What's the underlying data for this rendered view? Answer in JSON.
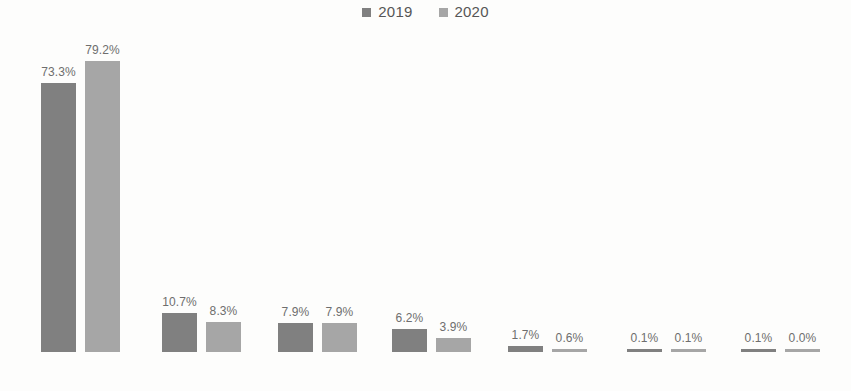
{
  "legend": {
    "position": "top-center",
    "entries": [
      {
        "label": "2019",
        "color": "#808080",
        "swatch_name": "legend-swatch-2019"
      },
      {
        "label": "2020",
        "color": "#a6a6a6",
        "swatch_name": "legend-swatch-2020"
      }
    ]
  },
  "axis": {
    "baseline_visible": true,
    "baseline_color": "#d8d8d6",
    "grid": false
  },
  "chart_data": {
    "type": "bar",
    "title": "",
    "subtitle": "",
    "xlabel": "",
    "ylabel": "",
    "ylim": [
      0,
      85
    ],
    "grid": false,
    "legend_position": "top-center",
    "value_format": "percent",
    "categories": [
      "China",
      "ASEAN",
      "United States",
      "Japan",
      "European  Union",
      "India",
      "Russia"
    ],
    "series": [
      {
        "name": "2019",
        "color": "#808080",
        "values": [
          73.3,
          10.7,
          7.9,
          6.2,
          1.7,
          0.1,
          0.1
        ],
        "labels": [
          "73.3%",
          "10.7%",
          "7.9%",
          "6.2%",
          "1.7%",
          "0.1%",
          "0.1%"
        ]
      },
      {
        "name": "2020",
        "color": "#a6a6a6",
        "values": [
          79.2,
          8.3,
          7.9,
          3.9,
          0.6,
          0.1,
          0.0
        ],
        "labels": [
          "79.2%",
          "8.3%",
          "7.9%",
          "3.9%",
          "0.6%",
          "0.1%",
          "0.0%"
        ]
      }
    ]
  }
}
